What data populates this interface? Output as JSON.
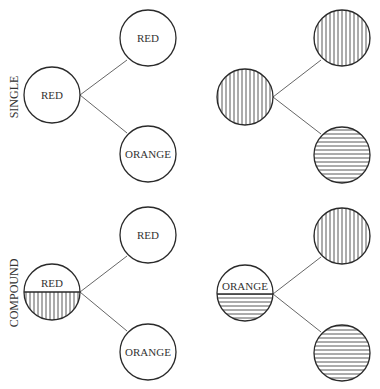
{
  "colors": {
    "stroke": "#2a2a2a",
    "edge": "#555555",
    "hatch": "#444444",
    "text": "#333333",
    "background": "#ffffff"
  },
  "rows": [
    {
      "label": "SINGLE",
      "labeled_tree": {
        "parent": {
          "text": "RED"
        },
        "children": [
          {
            "text": "RED"
          },
          {
            "text": "ORANGE"
          }
        ]
      },
      "pattern_tree": {
        "parent": {
          "pattern": "vertical-lines"
        },
        "children": [
          {
            "pattern": "vertical-lines"
          },
          {
            "pattern": "horizontal-lines"
          }
        ]
      }
    },
    {
      "label": "COMPOUND",
      "labeled_tree": {
        "parent": {
          "text": "RED",
          "lower_half_pattern": "vertical-lines"
        },
        "children": [
          {
            "text": "RED"
          },
          {
            "text": "ORANGE"
          }
        ]
      },
      "pattern_tree": {
        "parent": {
          "text": "ORANGE",
          "lower_half_pattern": "horizontal-lines"
        },
        "children": [
          {
            "pattern": "vertical-lines"
          },
          {
            "pattern": "horizontal-lines"
          }
        ]
      }
    }
  ]
}
